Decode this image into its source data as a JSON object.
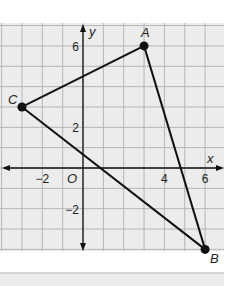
{
  "figure": {
    "type": "coordinate-plane-triangle",
    "axes": {
      "x_label": "x",
      "y_label": "y",
      "origin_label": "O"
    },
    "x_ticks": [
      {
        "value": -2,
        "label": "−2"
      },
      {
        "value": 4,
        "label": "4"
      },
      {
        "value": 6,
        "label": "6"
      }
    ],
    "y_ticks": [
      {
        "value": 6,
        "label": "6"
      },
      {
        "value": 2,
        "label": "2"
      },
      {
        "value": -2,
        "label": "−2"
      }
    ],
    "grid": {
      "x_min": -4,
      "x_max": 7,
      "y_min": -4,
      "y_max": 7
    },
    "points": [
      {
        "name": "A",
        "x": 3,
        "y": 6
      },
      {
        "name": "B",
        "x": 6,
        "y": -4
      },
      {
        "name": "C",
        "x": -3,
        "y": 3
      }
    ],
    "segments": [
      [
        "C",
        "A"
      ],
      [
        "A",
        "B"
      ],
      [
        "C",
        "B"
      ]
    ],
    "colors": {
      "grid_bg": "#ececec",
      "grid_line": "#b5b5b5",
      "stroke": "#111111"
    }
  }
}
